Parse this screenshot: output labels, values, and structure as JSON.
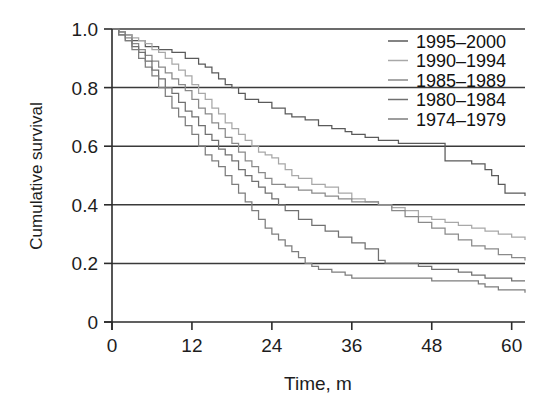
{
  "chart_data": {
    "type": "line",
    "title": "",
    "subtitle": "",
    "xlabel": "Time, m",
    "ylabel": "Cumulative survival",
    "xlim": [
      0,
      62
    ],
    "ylim": [
      0,
      1.0
    ],
    "xticks": [
      "0",
      "12",
      "24",
      "36",
      "48",
      "60"
    ],
    "xtick_values": [
      0,
      12,
      24,
      36,
      48,
      60
    ],
    "yticks": [
      "0",
      "0.2",
      "0.4",
      "0.6",
      "0.8",
      "1.0"
    ],
    "ytick_values": [
      0,
      0.2,
      0.4,
      0.6,
      0.8,
      1.0
    ],
    "grid": "horizontal",
    "legend_position": "top-right",
    "step_type": "post",
    "series": [
      {
        "name": "1995-2000",
        "color": "#5a5a5a",
        "x": [
          0,
          1,
          2,
          3,
          5,
          7,
          9,
          11,
          13,
          14,
          15,
          16,
          17,
          18,
          19,
          20,
          22,
          24,
          26,
          27,
          29,
          31,
          33,
          35,
          36,
          38,
          40,
          43,
          44,
          50,
          54,
          56,
          57,
          58,
          59,
          62
        ],
        "y": [
          1.0,
          0.99,
          0.98,
          0.96,
          0.94,
          0.93,
          0.92,
          0.9,
          0.88,
          0.87,
          0.85,
          0.83,
          0.81,
          0.8,
          0.78,
          0.76,
          0.75,
          0.73,
          0.71,
          0.7,
          0.69,
          0.67,
          0.66,
          0.65,
          0.64,
          0.63,
          0.62,
          0.61,
          0.61,
          0.55,
          0.54,
          0.52,
          0.5,
          0.47,
          0.44,
          0.43
        ]
      },
      {
        "name": "1990-1994",
        "color": "#a8a8a8",
        "x": [
          0,
          1,
          2,
          3,
          4,
          5,
          6,
          7,
          8,
          9,
          10,
          11,
          12,
          13,
          14,
          15,
          16,
          17,
          18,
          19,
          20,
          21,
          22,
          23,
          24,
          25,
          26,
          27,
          28,
          30,
          32,
          34,
          36,
          38,
          40,
          42,
          44,
          46,
          48,
          50,
          52,
          54,
          56,
          58,
          60,
          62
        ],
        "y": [
          1.0,
          0.99,
          0.98,
          0.97,
          0.96,
          0.95,
          0.93,
          0.92,
          0.9,
          0.88,
          0.86,
          0.84,
          0.81,
          0.78,
          0.76,
          0.73,
          0.71,
          0.68,
          0.66,
          0.64,
          0.62,
          0.6,
          0.58,
          0.57,
          0.56,
          0.54,
          0.52,
          0.5,
          0.49,
          0.47,
          0.46,
          0.44,
          0.42,
          0.41,
          0.4,
          0.39,
          0.38,
          0.36,
          0.35,
          0.34,
          0.33,
          0.32,
          0.31,
          0.3,
          0.29,
          0.28
        ]
      },
      {
        "name": "1985-1989",
        "color": "#8a8a8a",
        "x": [
          0,
          1,
          2,
          3,
          4,
          5,
          6,
          7,
          8,
          9,
          10,
          11,
          12,
          13,
          14,
          15,
          16,
          17,
          18,
          19,
          20,
          21,
          22,
          23,
          24,
          26,
          28,
          30,
          32,
          34,
          36,
          38,
          40,
          42,
          44,
          46,
          48,
          50,
          52,
          54,
          56,
          58,
          60,
          62
        ],
        "y": [
          1.0,
          0.99,
          0.97,
          0.95,
          0.93,
          0.91,
          0.89,
          0.87,
          0.85,
          0.83,
          0.81,
          0.79,
          0.76,
          0.73,
          0.71,
          0.68,
          0.66,
          0.63,
          0.61,
          0.58,
          0.55,
          0.53,
          0.51,
          0.49,
          0.47,
          0.46,
          0.45,
          0.44,
          0.43,
          0.42,
          0.41,
          0.41,
          0.4,
          0.38,
          0.36,
          0.34,
          0.32,
          0.3,
          0.28,
          0.26,
          0.25,
          0.23,
          0.22,
          0.21
        ]
      },
      {
        "name": "1980-1984",
        "color": "#707070",
        "x": [
          0,
          1,
          2,
          3,
          4,
          5,
          6,
          7,
          8,
          9,
          10,
          11,
          12,
          13,
          14,
          15,
          16,
          17,
          18,
          19,
          20,
          21,
          22,
          23,
          24,
          25,
          26,
          28,
          30,
          32,
          34,
          36,
          38,
          40,
          41,
          44,
          46,
          48,
          50,
          52,
          54,
          56,
          58,
          60,
          62
        ],
        "y": [
          1.0,
          0.98,
          0.96,
          0.94,
          0.92,
          0.89,
          0.86,
          0.83,
          0.8,
          0.78,
          0.75,
          0.72,
          0.7,
          0.67,
          0.64,
          0.62,
          0.59,
          0.57,
          0.55,
          0.52,
          0.5,
          0.48,
          0.46,
          0.44,
          0.42,
          0.4,
          0.38,
          0.35,
          0.33,
          0.31,
          0.29,
          0.27,
          0.25,
          0.21,
          0.2,
          0.2,
          0.19,
          0.18,
          0.18,
          0.17,
          0.16,
          0.15,
          0.15,
          0.14,
          0.14
        ]
      },
      {
        "name": "1974-1979",
        "color": "#7d7d7d",
        "x": [
          0,
          1,
          2,
          3,
          4,
          5,
          6,
          7,
          8,
          9,
          10,
          11,
          12,
          13,
          14,
          15,
          16,
          17,
          18,
          19,
          20,
          21,
          22,
          23,
          24,
          25,
          26,
          27,
          28,
          29,
          30,
          31,
          33,
          35,
          36,
          38,
          40,
          44,
          48,
          52,
          55,
          56,
          58,
          60,
          62
        ],
        "y": [
          1.0,
          0.98,
          0.96,
          0.93,
          0.9,
          0.87,
          0.84,
          0.8,
          0.77,
          0.73,
          0.7,
          0.67,
          0.64,
          0.6,
          0.57,
          0.55,
          0.53,
          0.5,
          0.47,
          0.44,
          0.41,
          0.38,
          0.35,
          0.32,
          0.3,
          0.28,
          0.26,
          0.24,
          0.22,
          0.2,
          0.19,
          0.18,
          0.17,
          0.16,
          0.15,
          0.15,
          0.15,
          0.15,
          0.14,
          0.14,
          0.13,
          0.12,
          0.11,
          0.11,
          0.1
        ]
      }
    ]
  },
  "legend": {
    "items": [
      {
        "label": "1995–2000"
      },
      {
        "label": "1990–1994"
      },
      {
        "label": "1985–1989"
      },
      {
        "label": "1980–1984"
      },
      {
        "label": "1974–1979"
      }
    ]
  },
  "axes": {
    "y_title": "Cumulative survival",
    "x_title": "Time, m"
  },
  "colors": {
    "axis": "#2b2b2b",
    "grid": "#3a3a3a",
    "background": "#ffffff",
    "text": "#1a1a1a"
  }
}
